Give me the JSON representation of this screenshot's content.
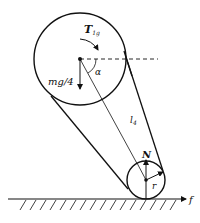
{
  "diagram": {
    "type": "free-body diagram",
    "labels": {
      "torque": "T",
      "torque_sub": "1g",
      "angle": "α",
      "weight": "mg/4",
      "length": "l",
      "length_sub": "4",
      "normal": "N",
      "radius": "r",
      "friction": "f"
    },
    "elements": {
      "large_circle": {
        "cx": 80,
        "cy": 59,
        "r": 46
      },
      "small_circle": {
        "cx": 146,
        "cy": 180,
        "r": 19
      },
      "ground_y": 199
    },
    "colors": {
      "stroke": "#111111",
      "background": "#ffffff"
    }
  }
}
